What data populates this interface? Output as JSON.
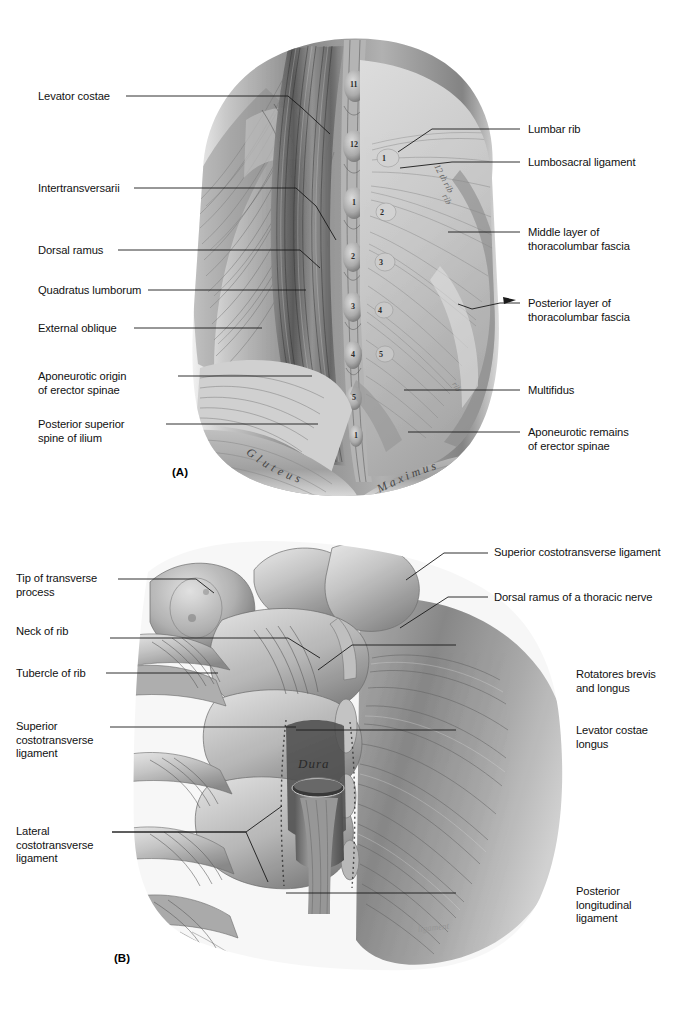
{
  "figure": {
    "background_color": "#ffffff",
    "ink_color": "#1a1a1a"
  },
  "panels": [
    {
      "tag": "(A)",
      "caption": "Deep dissection of the posterior lumbar region showing erector spinae, thoracolumbar fascia and quadratus lumborum",
      "labels_left": [
        {
          "text": "Levator costae"
        },
        {
          "text": "Intertransversarii"
        },
        {
          "text": "Dorsal ramus"
        },
        {
          "text": "Quadratus lumborum"
        },
        {
          "text": "External oblique"
        },
        {
          "text": "Aponeurotic origin\nof erector spinae"
        },
        {
          "text": "Posterior superior\nspine of ilium"
        }
      ],
      "labels_right": [
        {
          "text": "Lumbar rib"
        },
        {
          "text": "Lumbosacral ligament"
        },
        {
          "text": "Middle layer of\nthoracolumbar fascia"
        },
        {
          "text": "Posterior layer of\nthoracolumbar fascia"
        },
        {
          "text": "Multifidus"
        },
        {
          "text": "Aponeurotic remains\nof erector spinae"
        }
      ],
      "in_image_text": [
        {
          "text": "Gluteus",
          "style": "curved-script"
        },
        {
          "text": "Maximus",
          "style": "curved-script"
        },
        {
          "text": "12 th rib",
          "style": "faint-script"
        }
      ],
      "spinous_process_numbers": [
        "11",
        "12",
        "1",
        "2",
        "3",
        "4",
        "5",
        "1"
      ],
      "rib_numbers": [
        "1",
        "2",
        "3",
        "4",
        "5"
      ]
    },
    {
      "tag": "(B)",
      "caption": "Posterior view of thoracic vertebrae showing costotransverse ligaments, rotatores and levator costae longus",
      "labels_left": [
        {
          "text": "Tip of transverse\nprocess"
        },
        {
          "text": "Neck of rib"
        },
        {
          "text": "Tubercle of rib"
        },
        {
          "text": "Superior\ncostotransverse\nligament"
        },
        {
          "text": "Lateral\ncostotransverse\nligament"
        }
      ],
      "labels_right": [
        {
          "text": "Superior costotransverse ligament"
        },
        {
          "text": "Dorsal ramus of a thoracic nerve"
        },
        {
          "text": "Rotatores brevis\nand longus"
        },
        {
          "text": "Levator costae\nlongus"
        },
        {
          "text": "Posterior\nlongitudinal\nligament"
        }
      ],
      "in_image_text": [
        {
          "text": "Dura",
          "style": "script"
        }
      ]
    }
  ]
}
